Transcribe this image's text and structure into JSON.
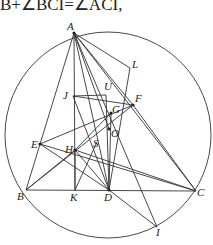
{
  "caption": "B+∠BCI=∠ACI,",
  "figure": {
    "circle": {
      "cx": 108,
      "cy": 135,
      "r": 103
    },
    "points": {
      "A": {
        "x": 74,
        "y": 33,
        "label": "A",
        "lx": 67,
        "ly": 30
      },
      "L": {
        "x": 130,
        "y": 68,
        "label": "L",
        "lx": 132,
        "ly": 68
      },
      "U": {
        "x": 106,
        "y": 95,
        "label": "U",
        "lx": 104,
        "ly": 90
      },
      "J": {
        "x": 73,
        "y": 96,
        "label": "J",
        "lx": 63,
        "ly": 99
      },
      "F": {
        "x": 133,
        "y": 105,
        "label": "F",
        "lx": 135,
        "ly": 102
      },
      "G": {
        "x": 111,
        "y": 113,
        "label": "G",
        "lx": 112,
        "ly": 113
      },
      "O": {
        "x": 109,
        "y": 129,
        "label": "O",
        "lx": 111,
        "ly": 137
      },
      "S": {
        "x": 97,
        "y": 142,
        "label": "S",
        "lx": 93,
        "ly": 147
      },
      "H": {
        "x": 75,
        "y": 150,
        "label": "H",
        "lx": 65,
        "ly": 153
      },
      "E": {
        "x": 40,
        "y": 144,
        "label": "E",
        "lx": 31,
        "ly": 148
      },
      "B": {
        "x": 26,
        "y": 190,
        "label": "B",
        "lx": 17,
        "ly": 200
      },
      "K": {
        "x": 75,
        "y": 190,
        "label": "K",
        "lx": 70,
        "ly": 201
      },
      "D": {
        "x": 109,
        "y": 190,
        "label": "D",
        "lx": 104,
        "ly": 201
      },
      "C": {
        "x": 196,
        "y": 191,
        "label": "C",
        "lx": 197,
        "ly": 196
      },
      "I": {
        "x": 157,
        "y": 227,
        "label": "I",
        "lx": 156,
        "ly": 236
      }
    },
    "segments": [
      [
        "A",
        "B"
      ],
      [
        "A",
        "C"
      ],
      [
        "B",
        "C"
      ],
      [
        "A",
        "K"
      ],
      [
        "A",
        "D"
      ],
      [
        "A",
        "L"
      ],
      [
        "A",
        "F"
      ],
      [
        "A",
        "I"
      ],
      [
        "A",
        "O"
      ],
      [
        "L",
        "D"
      ],
      [
        "J",
        "U"
      ],
      [
        "J",
        "F"
      ],
      [
        "U",
        "D"
      ],
      [
        "E",
        "F"
      ],
      [
        "E",
        "C"
      ],
      [
        "E",
        "D"
      ],
      [
        "B",
        "F"
      ],
      [
        "B",
        "H"
      ],
      [
        "H",
        "C"
      ],
      [
        "H",
        "D"
      ],
      [
        "H",
        "G"
      ],
      [
        "K",
        "H"
      ],
      [
        "D",
        "I"
      ],
      [
        "F",
        "C"
      ],
      [
        "G",
        "D"
      ],
      [
        "J",
        "D"
      ],
      [
        "S",
        "K"
      ]
    ],
    "dots": [
      "A",
      "H",
      "O",
      "G",
      "F",
      "D",
      "E"
    ]
  }
}
